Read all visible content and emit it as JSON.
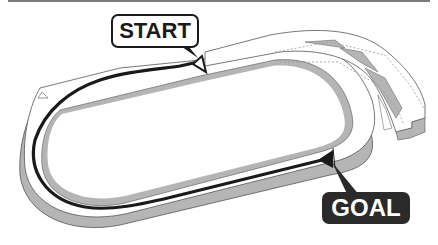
{
  "diagram": {
    "type": "racecourse-map",
    "labels": {
      "start": "START",
      "goal": "GOAL"
    },
    "markers": {
      "start_marker": "hollow-triangle",
      "goal_marker": "filled-triangle"
    },
    "colors": {
      "track_surface": "#ffffff",
      "track_edge": "#b5b5b5",
      "route_line": "#1a1a1a",
      "outline": "#555555",
      "goal_label_bg": "#2a2a2a",
      "start_label_bg": "#ffffff"
    },
    "route": {
      "description": "Route runs from START on the upper straight, around the left turn, along the lower straight to GOAL"
    }
  }
}
